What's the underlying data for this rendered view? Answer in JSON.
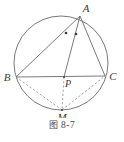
{
  "figure": {
    "caption_prefix": "图",
    "caption_number": "8-7",
    "caption_full": "图 8-7",
    "type": "plane-geometry-circle-diagram",
    "stroke_color": "#6b6b6b",
    "label_color": "#3a3a3a",
    "background_color": "#ffffff",
    "circle": {
      "center_x": 61,
      "center_y": 63,
      "radius": 47
    },
    "points": [
      {
        "id": "A",
        "label": "A",
        "x": 80,
        "y": 16,
        "label_x": 86,
        "label_y": 12
      },
      {
        "id": "B",
        "label": "B",
        "x": 16,
        "y": 77,
        "label_x": 7,
        "label_y": 81
      },
      {
        "id": "C",
        "label": "C",
        "x": 105,
        "y": 76,
        "label_x": 110,
        "label_y": 80
      },
      {
        "id": "P",
        "label": "P",
        "x": 64,
        "y": 77,
        "label_x": 66,
        "label_y": 87
      },
      {
        "id": "M",
        "label": "M",
        "x": 62,
        "y": 110,
        "label_x": 58,
        "label_y": 122
      }
    ],
    "solid_segments": [
      {
        "name": "AB",
        "from": "A",
        "to": "B"
      },
      {
        "name": "AC",
        "from": "A",
        "to": "C"
      },
      {
        "name": "BC",
        "from": "B",
        "to": "C"
      },
      {
        "name": "AP",
        "from": "A",
        "to": "P"
      }
    ],
    "dashed_segments": [
      {
        "name": "BM",
        "from": "B",
        "to": "M"
      },
      {
        "name": "MC",
        "from": "M",
        "to": "C"
      },
      {
        "name": "PM",
        "from": "P",
        "to": "M"
      }
    ],
    "angle_marks": [
      {
        "name": "angle-BAP-dot",
        "x": 66,
        "y": 33
      },
      {
        "name": "angle-PAC-dot",
        "x": 76,
        "y": 34
      }
    ]
  }
}
